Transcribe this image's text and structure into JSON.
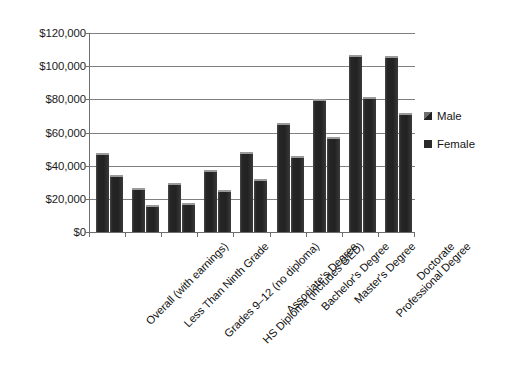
{
  "chart_data": {
    "type": "bar",
    "title": "",
    "subtitle": "",
    "xlabel": "",
    "ylabel": "",
    "ylim": [
      0,
      120000
    ],
    "ytick_values": [
      0,
      20000,
      40000,
      60000,
      80000,
      100000,
      120000
    ],
    "ytick_labels": [
      "$0",
      "$20,000",
      "$40,000",
      "$60,000",
      "$80,000",
      "$100,000",
      "$120,000"
    ],
    "grid": "horizontal",
    "legend_position": "right",
    "categories": [
      "Overall (with earnings)",
      "Less Than Ninth Grade",
      "Grades 9–12 (no diploma)",
      "HS Diploma (includes GED)",
      "Associate's Degree",
      "Bachelor's Degree",
      "Master's Degree",
      "Professional Degree",
      "Doctorate"
    ],
    "series": [
      {
        "name": "Male",
        "color": "#2b2b2b",
        "values": [
          47600,
          26500,
          29700,
          37400,
          48200,
          65700,
          80000,
          106500,
          106000
        ]
      },
      {
        "name": "Female",
        "color": "#2b2b2b",
        "values": [
          34600,
          16500,
          17600,
          25400,
          31700,
          45600,
          57200,
          81200,
          72000
        ]
      }
    ]
  },
  "legend": {
    "entries": [
      {
        "label": "Male",
        "swatch": "legend-swatch-male"
      },
      {
        "label": "Female",
        "swatch": "legend-swatch-female"
      }
    ]
  }
}
